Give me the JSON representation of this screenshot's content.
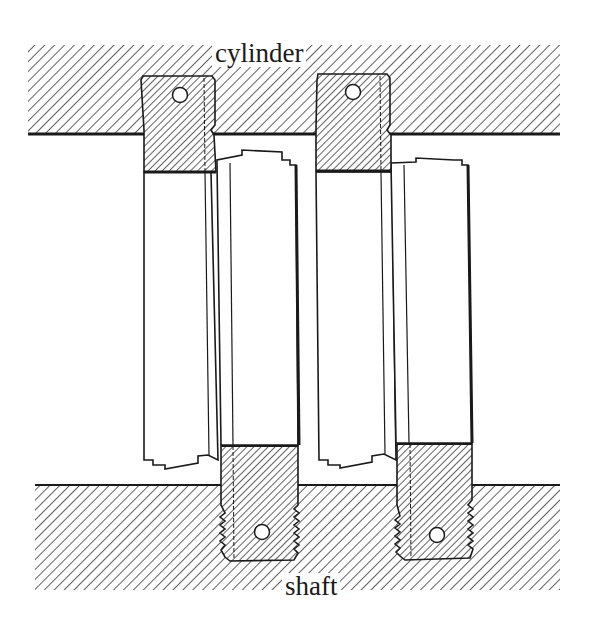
{
  "figure": {
    "type": "mechanical cross-section diagram",
    "labels": {
      "top": "cylinder",
      "bottom": "shaft"
    },
    "components": [
      {
        "name": "cylinder",
        "region": "top hatched body"
      },
      {
        "name": "shaft",
        "region": "bottom hatched body"
      },
      {
        "name": "cylinder-block-left",
        "feature": "pin hole"
      },
      {
        "name": "cylinder-block-right",
        "feature": "pin hole"
      },
      {
        "name": "shaft-block-left",
        "feature": "threaded, pin hole"
      },
      {
        "name": "shaft-block-right",
        "feature": "threaded, pin hole"
      },
      {
        "name": "vane-panel-1"
      },
      {
        "name": "vane-panel-2"
      },
      {
        "name": "vane-panel-3"
      },
      {
        "name": "vane-panel-4"
      }
    ],
    "colors": {
      "ink": "#1a1a1a",
      "hatch": "#3a3a3a",
      "background": "#ffffff"
    }
  }
}
